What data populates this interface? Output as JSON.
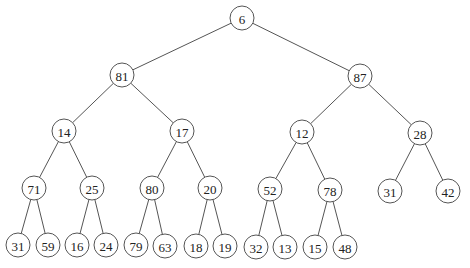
{
  "diagram": {
    "type": "binary-tree",
    "node_radius": 12,
    "nodes": [
      {
        "id": "n0",
        "label": "6",
        "x": 242,
        "y": 18
      },
      {
        "id": "n1",
        "label": "81",
        "x": 122,
        "y": 75
      },
      {
        "id": "n2",
        "label": "87",
        "x": 360,
        "y": 76
      },
      {
        "id": "n3",
        "label": "14",
        "x": 64,
        "y": 131
      },
      {
        "id": "n4",
        "label": "17",
        "x": 182,
        "y": 131
      },
      {
        "id": "n5",
        "label": "12",
        "x": 302,
        "y": 132
      },
      {
        "id": "n6",
        "label": "28",
        "x": 420,
        "y": 133
      },
      {
        "id": "n7",
        "label": "71",
        "x": 34,
        "y": 188
      },
      {
        "id": "n8",
        "label": "25",
        "x": 92,
        "y": 188
      },
      {
        "id": "n9",
        "label": "80",
        "x": 152,
        "y": 188
      },
      {
        "id": "n10",
        "label": "20",
        "x": 210,
        "y": 188
      },
      {
        "id": "n11",
        "label": "52",
        "x": 270,
        "y": 189
      },
      {
        "id": "n12",
        "label": "78",
        "x": 330,
        "y": 190
      },
      {
        "id": "n13",
        "label": "31",
        "x": 390,
        "y": 191
      },
      {
        "id": "n14",
        "label": "42",
        "x": 448,
        "y": 191
      },
      {
        "id": "n15",
        "label": "31",
        "x": 18,
        "y": 245
      },
      {
        "id": "n16",
        "label": "59",
        "x": 48,
        "y": 245
      },
      {
        "id": "n17",
        "label": "16",
        "x": 77,
        "y": 245
      },
      {
        "id": "n18",
        "label": "24",
        "x": 106,
        "y": 245
      },
      {
        "id": "n19",
        "label": "79",
        "x": 136,
        "y": 245
      },
      {
        "id": "n20",
        "label": "63",
        "x": 165,
        "y": 246
      },
      {
        "id": "n21",
        "label": "18",
        "x": 196,
        "y": 246
      },
      {
        "id": "n22",
        "label": "19",
        "x": 225,
        "y": 246
      },
      {
        "id": "n23",
        "label": "32",
        "x": 256,
        "y": 247
      },
      {
        "id": "n24",
        "label": "13",
        "x": 285,
        "y": 247
      },
      {
        "id": "n25",
        "label": "15",
        "x": 315,
        "y": 247
      },
      {
        "id": "n26",
        "label": "48",
        "x": 345,
        "y": 247
      }
    ],
    "edges": [
      [
        "n0",
        "n1"
      ],
      [
        "n0",
        "n2"
      ],
      [
        "n1",
        "n3"
      ],
      [
        "n1",
        "n4"
      ],
      [
        "n2",
        "n5"
      ],
      [
        "n2",
        "n6"
      ],
      [
        "n3",
        "n7"
      ],
      [
        "n3",
        "n8"
      ],
      [
        "n4",
        "n9"
      ],
      [
        "n4",
        "n10"
      ],
      [
        "n5",
        "n11"
      ],
      [
        "n5",
        "n12"
      ],
      [
        "n6",
        "n13"
      ],
      [
        "n6",
        "n14"
      ],
      [
        "n7",
        "n15"
      ],
      [
        "n7",
        "n16"
      ],
      [
        "n8",
        "n17"
      ],
      [
        "n8",
        "n18"
      ],
      [
        "n9",
        "n19"
      ],
      [
        "n9",
        "n20"
      ],
      [
        "n10",
        "n21"
      ],
      [
        "n10",
        "n22"
      ],
      [
        "n11",
        "n23"
      ],
      [
        "n11",
        "n24"
      ],
      [
        "n12",
        "n25"
      ],
      [
        "n12",
        "n26"
      ]
    ],
    "colors": {
      "stroke": "#555555",
      "fill": "#ffffff",
      "text": "#222222"
    }
  }
}
